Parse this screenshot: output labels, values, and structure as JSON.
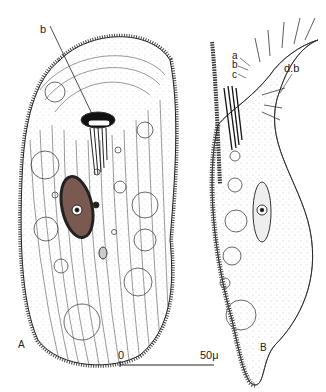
{
  "figure": {
    "panel_a": {
      "label": "A",
      "annotations": [
        {
          "id": "b",
          "text": "b"
        }
      ]
    },
    "panel_b": {
      "label": "B",
      "annotations": [
        {
          "id": "a",
          "text": "a"
        },
        {
          "id": "b",
          "text": "b"
        },
        {
          "id": "c",
          "text": "c"
        },
        {
          "id": "db",
          "text": "d.b"
        }
      ]
    },
    "scale_bar": {
      "start": "0",
      "end": "50μ"
    }
  }
}
